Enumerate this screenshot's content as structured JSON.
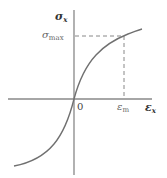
{
  "diagram": {
    "type": "stress-strain curve",
    "colors": {
      "axis": "#888888",
      "curve": "#707070",
      "dashed": "#888888",
      "label": "#333333",
      "marker_label": "#666666"
    },
    "axes": {
      "y_label_symbol": "σ",
      "y_label_sub": "x",
      "x_label_symbol": "ε",
      "x_label_sub": "x",
      "origin_label": "0"
    },
    "markers": {
      "sigma_max_symbol": "σ",
      "sigma_max_sub": "max",
      "epsilon_m_symbol": "ε",
      "epsilon_m_sub": "m"
    },
    "geometry": {
      "origin": [
        74,
        99
      ],
      "x_axis": [
        8,
        152
      ],
      "y_axis": [
        10,
        175
      ],
      "curve_points": [
        [
          14,
          166
        ],
        [
          34,
          162
        ],
        [
          50,
          150
        ],
        [
          62,
          132
        ],
        [
          70,
          112
        ],
        [
          74,
          99
        ],
        [
          78,
          85
        ],
        [
          84,
          70
        ],
        [
          96,
          53
        ],
        [
          110,
          42
        ],
        [
          124,
          36
        ],
        [
          142,
          29
        ]
      ],
      "sigma_max_y": 36,
      "epsilon_m_x": 124
    }
  }
}
